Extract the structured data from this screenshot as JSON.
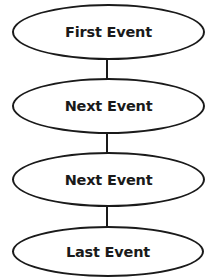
{
  "diagram": {
    "type": "flowchart",
    "orientation": "vertical",
    "colors": {
      "stroke": "#1a1a1a",
      "fill": "#ffffff",
      "text": "#1a1a1a"
    },
    "nodes": [
      {
        "id": "n1",
        "shape": "ellipse",
        "label": "First Event"
      },
      {
        "id": "n2",
        "shape": "ellipse",
        "label": "Next Event"
      },
      {
        "id": "n3",
        "shape": "ellipse",
        "label": "Next Event"
      },
      {
        "id": "n4",
        "shape": "ellipse",
        "label": "Last Event"
      }
    ],
    "edges": [
      {
        "from": "n1",
        "to": "n2"
      },
      {
        "from": "n2",
        "to": "n3"
      },
      {
        "from": "n3",
        "to": "n4"
      }
    ]
  }
}
